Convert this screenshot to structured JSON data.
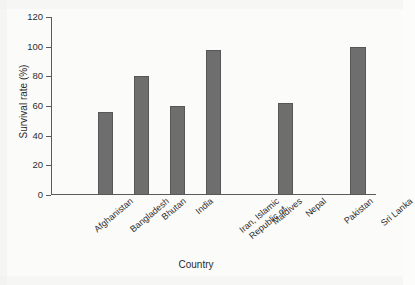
{
  "chart_data": {
    "type": "bar",
    "title": "",
    "xlabel": "Country",
    "ylabel": "Survival rate (%)",
    "categories": [
      "Afghanistan",
      "Bangladesh",
      "Bhutan",
      "India",
      "Iran, Islamic\nRepublic of",
      "Maldives",
      "Nepal",
      "Pakistan",
      "Sri Lanka"
    ],
    "values": [
      0,
      56,
      80,
      60,
      98,
      0,
      62,
      0,
      100
    ],
    "ylim": [
      0,
      120
    ],
    "yticks": [
      0,
      20,
      40,
      60,
      80,
      100,
      120
    ],
    "ytick_labels": [
      "0",
      "20",
      "40",
      "60",
      "80",
      "100",
      "120"
    ],
    "grid": false,
    "legend": false,
    "bar_color": "#6e6e6e",
    "bar_edge_color": "#575757",
    "axis_color": "#5b5b5b",
    "background_color": "#fbfbf9"
  }
}
